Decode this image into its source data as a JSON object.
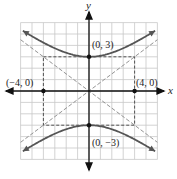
{
  "chart_data": {
    "type": "line",
    "title": "",
    "xlabel": "x",
    "ylabel": "y",
    "xlim": [
      -6,
      6
    ],
    "ylim": [
      -6,
      6
    ],
    "grid": true,
    "equation": "y^2/9 - x^2/16 = 1",
    "series": [
      {
        "name": "upper-branch",
        "style": "solid",
        "description": "y = 3*sqrt(1 + x^2/16)"
      },
      {
        "name": "lower-branch",
        "style": "solid",
        "description": "y = -3*sqrt(1 + x^2/16)"
      },
      {
        "name": "asymptote-1",
        "style": "dashed",
        "description": "y = 3x/4"
      },
      {
        "name": "asymptote-2",
        "style": "dashed",
        "description": "y = -3x/4"
      },
      {
        "name": "central-rectangle",
        "style": "dashed",
        "corners": [
          [
            -4,
            3
          ],
          [
            4,
            3
          ],
          [
            4,
            -3
          ],
          [
            -4,
            -3
          ]
        ]
      }
    ],
    "points": [
      {
        "label": "(0, 3)",
        "x": 0,
        "y": 3
      },
      {
        "label": "(0, −3)",
        "x": 0,
        "y": -3
      },
      {
        "label": "(−4, 0)",
        "x": -4,
        "y": 0
      },
      {
        "label": "(4, 0)",
        "x": 4,
        "y": 0
      }
    ]
  },
  "labels": {
    "x_axis": "x",
    "y_axis": "y",
    "vertex_top": "(0, 3)",
    "vertex_bottom": "(0, −3)",
    "co_vertex_left": "(−4, 0)",
    "co_vertex_right": "(4, 0)"
  }
}
